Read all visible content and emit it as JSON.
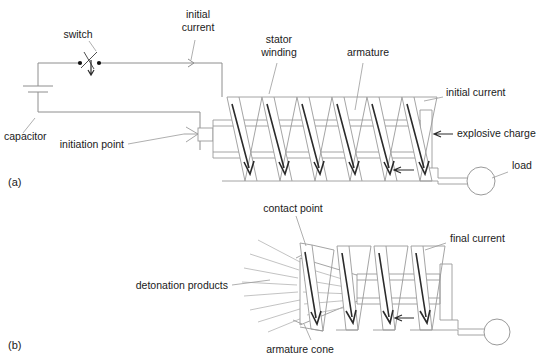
{
  "figure": {
    "background_color": "#ffffff",
    "line_color": "#9a9a9a",
    "arrow_color": "#2b2b2b",
    "text_color": "#1a1a1a"
  },
  "panels": [
    {
      "id": "a",
      "label": "(a)",
      "caption_x": 8,
      "caption_y": 186
    },
    {
      "id": "b",
      "label": "(b)",
      "caption_x": 8,
      "caption_y": 349
    }
  ],
  "panel_a": {
    "labels": {
      "switch": "switch",
      "initial_current_top_line1": "initial",
      "initial_current_top_line2": "current",
      "stator_winding_line1": "stator",
      "stator_winding_line2": "winding",
      "armature": "armature",
      "initial_current_right": "initial current",
      "capacitor": "capacitor",
      "initiation_point": "initiation point",
      "explosive_charge": "explosive charge",
      "load": "load"
    },
    "coil_turns": 6,
    "current_arrows": 6,
    "compression_arrow": "leftward"
  },
  "panel_b": {
    "labels": {
      "contact_point": "contact point",
      "final_current": "final current",
      "detonation_products": "detonation products",
      "armature_cone": "armature cone"
    },
    "coil_turns": 4,
    "current_arrows": 4,
    "detonation_rays": 8,
    "compression_arrow": "leftward"
  }
}
